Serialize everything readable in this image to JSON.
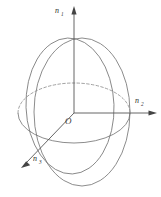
{
  "figure": {
    "name": "optical-indicatrix-ellipsoid",
    "background_color": "#ffffff",
    "line_color": "#6e6e6e",
    "dashed_line_color": "#8a8a8a",
    "label_color": "#2b2b2b"
  },
  "origin": {
    "label": "O"
  },
  "axes": [
    {
      "key": "vertical",
      "base": "n",
      "subscript": "1",
      "label": "n1",
      "direction": "up",
      "arrow": true
    },
    {
      "key": "right",
      "base": "n",
      "subscript": "2",
      "label": "n2",
      "direction": "right",
      "arrow": true
    },
    {
      "key": "front",
      "base": "n",
      "subscript": "3",
      "label": "n3",
      "direction": "down-left",
      "arrow": true
    }
  ],
  "shapes": {
    "outer_ellipse": "solid-outline",
    "tilted_ellipse": "solid-outline",
    "equator_front_arc": "solid",
    "equator_back_arc": "dashed"
  }
}
